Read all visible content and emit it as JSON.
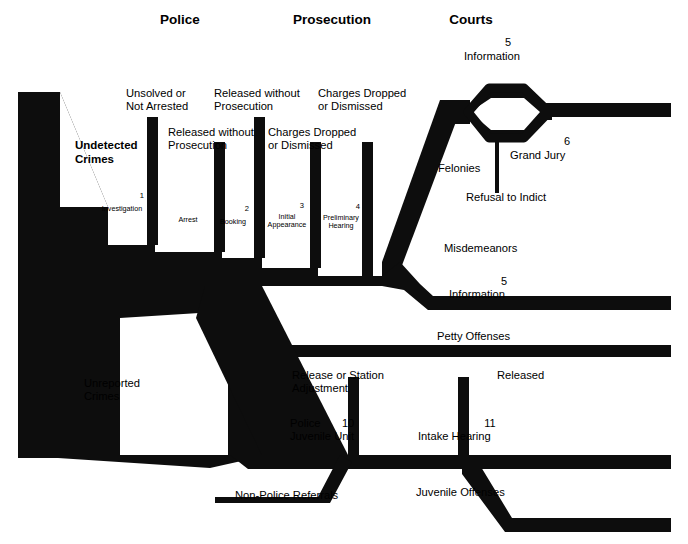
{
  "diagram": {
    "title_columns": [
      {
        "label": "Police"
      },
      {
        "label": "Prosecution"
      },
      {
        "label": "Courts"
      }
    ],
    "ink_color": "#0d0d0d",
    "background": "#ffffff",
    "inflow_labels": [
      {
        "label": "Undetected\nCrimes"
      },
      {
        "label": "Unreported\nCrimes"
      }
    ],
    "exit_labels": [
      {
        "label": "Unsolved or\nNot Arrested"
      },
      {
        "label": "Released without\nProsecution"
      },
      {
        "label": "Released without\nProsecution"
      },
      {
        "label": "Charges Dropped\nor Dismissed"
      },
      {
        "label": "Charges Dropped\nor Dismissed"
      },
      {
        "label": "Refusal to Indict"
      },
      {
        "label": "Release or Station\nAdjustment"
      },
      {
        "label": "Released"
      }
    ],
    "steps": [
      {
        "num": "1",
        "label": "Investigation"
      },
      {
        "num": "",
        "label": "Arrest"
      },
      {
        "num": "2",
        "label": "Booking"
      },
      {
        "num": "3",
        "label": "Initial\nAppearance"
      },
      {
        "num": "4",
        "label": "Preliminary\nHearing"
      },
      {
        "num": "10",
        "label": "Police\nJuvenile Unit"
      },
      {
        "num": "11",
        "label": "Intake Hearing"
      }
    ],
    "court_nodes": [
      {
        "num": "5",
        "label": "Information"
      },
      {
        "num": "6",
        "label": "Grand Jury"
      },
      {
        "num": "5",
        "label": "Information"
      }
    ],
    "route_labels": [
      {
        "label": "Felonies"
      },
      {
        "label": "Misdemeanors"
      },
      {
        "label": "Petty Offenses"
      },
      {
        "label": "Juvenile Offenses"
      },
      {
        "label": "Non-Police Referrals"
      }
    ]
  }
}
